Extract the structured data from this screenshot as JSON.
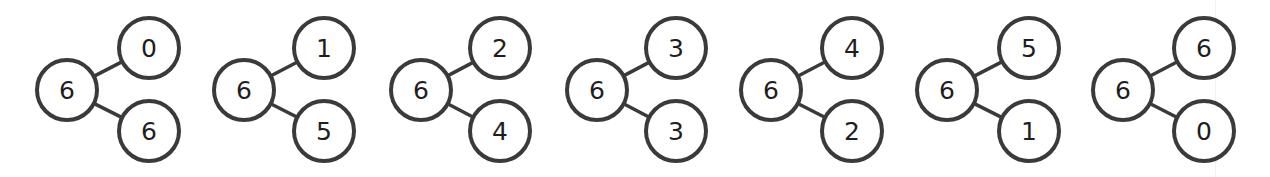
{
  "style": {
    "stroke_color": "#3a3a3a",
    "text_color": "#1e1e1e",
    "background": "#ffffff"
  },
  "bonds": [
    {
      "whole": "6",
      "part_top": "0",
      "part_bottom": "6"
    },
    {
      "whole": "6",
      "part_top": "1",
      "part_bottom": "5"
    },
    {
      "whole": "6",
      "part_top": "2",
      "part_bottom": "4"
    },
    {
      "whole": "6",
      "part_top": "3",
      "part_bottom": "3"
    },
    {
      "whole": "6",
      "part_top": "4",
      "part_bottom": "2"
    },
    {
      "whole": "6",
      "part_top": "5",
      "part_bottom": "1"
    },
    {
      "whole": "6",
      "part_top": "6",
      "part_bottom": "0"
    }
  ],
  "layout": {
    "whole_x": [
      67,
      244,
      421,
      597,
      771,
      947,
      1123
    ],
    "part_x": [
      149,
      324,
      500,
      676,
      852,
      1029,
      1204
    ],
    "whole_y": 90,
    "top_y": 48,
    "bottom_y": 131,
    "radius": 32
  }
}
